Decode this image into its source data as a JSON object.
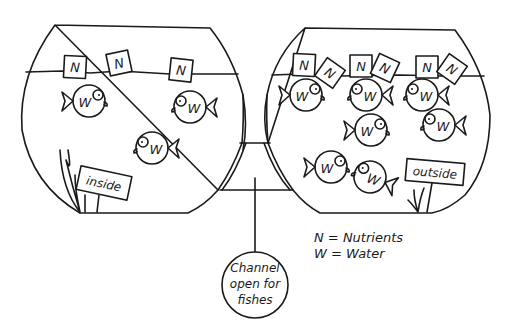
{
  "diagram": {
    "left_bowl": {
      "label": "inside",
      "nutrient_symbol": "N",
      "nutrient_count": 3,
      "water_symbol": "W",
      "water_count": 3
    },
    "right_bowl": {
      "label": "outside",
      "nutrient_symbol": "N",
      "nutrient_count": 6,
      "water_symbol": "W",
      "water_count": 7
    },
    "channel": {
      "label_line1": "Channel",
      "label_line2": "open for",
      "label_line3": "fishes"
    },
    "legend": {
      "nutrients": "N = Nutrients",
      "water": "W = Water"
    },
    "colors": {
      "ink": "#1a1a1a",
      "background": "#ffffff"
    }
  }
}
